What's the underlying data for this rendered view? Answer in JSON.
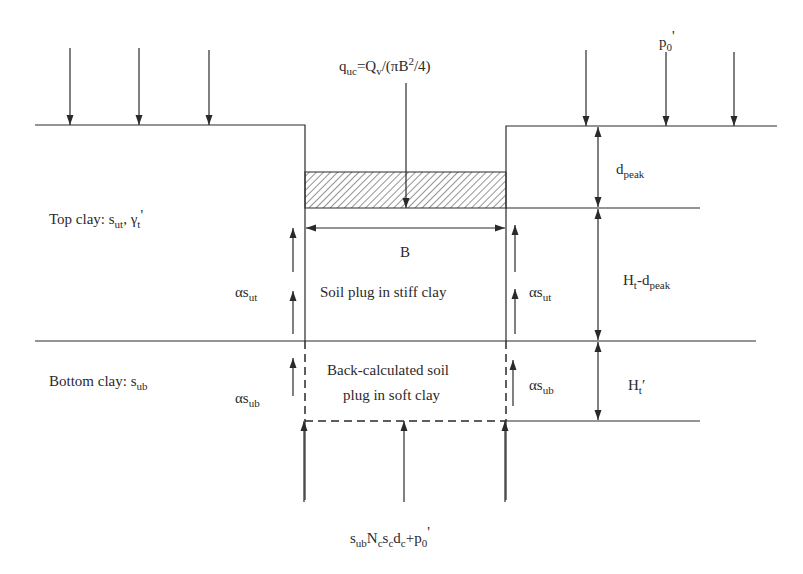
{
  "figure": {
    "type": "geotechnical-schematic"
  },
  "labels": {
    "load": {
      "base": "q",
      "sub": "uc",
      "rest": "=Q",
      "sub2": "v",
      "rest2": "/(πB",
      "sup": "2",
      "rest3": "/4)"
    },
    "surcharge": {
      "base": "p",
      "sub": "0",
      "rest": "'"
    },
    "top_clay": {
      "prefix": "Top clay: s",
      "sub": "ut",
      "mid": ", γ",
      "sub2": "t",
      "rest": "'"
    },
    "bottom_clay": {
      "prefix": "Bottom clay: s",
      "sub": "ub"
    },
    "width": "B",
    "plug_stiff": "Soil plug in stiff clay",
    "plug_soft_line1": "Back-calculated soil",
    "plug_soft_line2": "plug in soft clay",
    "shear_top_left": {
      "base": "αs",
      "sub": "ut"
    },
    "shear_top_right": {
      "base": "αs",
      "sub": "ut"
    },
    "shear_bottom_left": {
      "base": "αs",
      "sub": "ub"
    },
    "shear_bottom_right": {
      "base": "αs",
      "sub": "ub"
    },
    "dim_dpeak": {
      "base": "d",
      "sub": "peak"
    },
    "dim_ht_minus": {
      "base": "H",
      "sub": "t",
      "mid": "-d",
      "sub2": "peak"
    },
    "dim_ht_prime": {
      "base": "H",
      "sub": "t",
      "rest": "′"
    },
    "base_resistance": {
      "s": "s",
      "sub1": "ub",
      "N": "N",
      "sub2": "c",
      "s2": "s",
      "sub3": "c",
      "d": "d",
      "sub4": "c",
      "rest": "+p",
      "sub5": "0",
      "rest2": "'"
    }
  },
  "colors": {
    "line": "#2a2a2a",
    "background": "#ffffff"
  }
}
